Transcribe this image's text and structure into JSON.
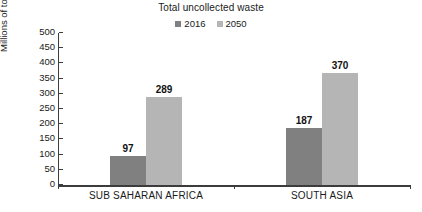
{
  "chart_data": {
    "type": "bar",
    "title": "Total uncollected waste",
    "xlabel": "",
    "ylabel": "Millions of tonnes",
    "categories": [
      "SUB SAHARAN AFRICA",
      "SOUTH ASIA"
    ],
    "series": [
      {
        "name": "2016",
        "values": [
          97,
          187
        ],
        "color": "#808080"
      },
      {
        "name": "2050",
        "values": [
          289,
          370
        ],
        "color": "#b5b5b5"
      }
    ],
    "ylim": [
      0,
      500
    ],
    "yticks": [
      0,
      50,
      100,
      150,
      200,
      250,
      300,
      350,
      400,
      450,
      500
    ],
    "ytick_labels": [
      "0",
      "50",
      "100",
      "150",
      "200",
      "250",
      "300",
      "350",
      "400",
      "450",
      "500"
    ],
    "grid": false,
    "legend_position": "top-center",
    "data_labels": [
      "97",
      "289",
      "187",
      "370"
    ]
  },
  "legend": [
    {
      "label": "2016",
      "color": "#808080"
    },
    {
      "label": "2050",
      "color": "#b5b5b5"
    }
  ],
  "axis": {
    "y_title": "Millions of tonnes"
  },
  "colors": {
    "series_2016": "#808080",
    "series_2050": "#b5b5b5",
    "axis": "#3c3c3c",
    "text": "#1a1a1a",
    "background": "#ffffff"
  }
}
